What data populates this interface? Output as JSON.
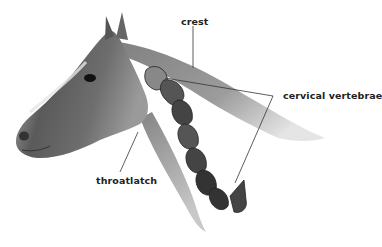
{
  "diagram": {
    "labels": {
      "crest": "crest",
      "cervical_vertebrae": "cervical vertebrae",
      "throatlatch": "throatlatch"
    }
  }
}
